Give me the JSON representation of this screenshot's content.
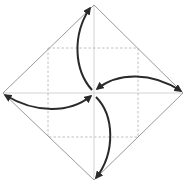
{
  "diagram": {
    "type": "origami-fold-diagram",
    "colors": {
      "background": "#ffffff",
      "outline": "#9a9a9a",
      "guide": "#c8c8c8",
      "dashed": "#b0b0b0",
      "arrow": "#2a2a2a"
    },
    "diamond": {
      "top": [
        94,
        5
      ],
      "right": [
        183,
        93
      ],
      "bottom": [
        94,
        180
      ],
      "left": [
        3,
        93
      ]
    },
    "center": [
      94,
      93
    ],
    "dashed_square": {
      "x1": 48,
      "y1": 48,
      "x2": 138,
      "y2": 137
    },
    "arrows": [
      {
        "name": "arrow-to-top",
        "from": [
          92,
          90
        ],
        "to": [
          90,
          7
        ]
      },
      {
        "name": "arrow-to-right",
        "from": [
          97,
          90
        ],
        "to": [
          181,
          91
        ]
      },
      {
        "name": "arrow-to-bottom",
        "from": [
          96,
          96
        ],
        "to": [
          97,
          178
        ]
      },
      {
        "name": "arrow-to-left",
        "from": [
          91,
          95
        ],
        "to": [
          5,
          95
        ]
      }
    ]
  }
}
